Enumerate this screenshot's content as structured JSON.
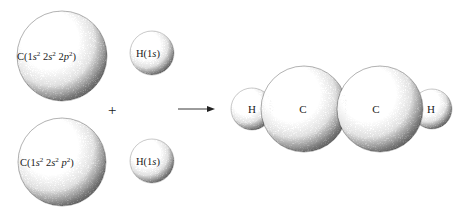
{
  "diagram": {
    "type": "reaction-schematic",
    "colors": {
      "background": "#ffffff",
      "sphere_light": "#ffffff",
      "sphere_dark": "#1a1a1a",
      "text": "#1a1a1a"
    },
    "reactants": [
      {
        "id": "carbon-top",
        "element": "C",
        "config_text": "C(1s² 2s² 2p²)",
        "parts": {
          "prefix": "C(1",
          "s1": "s",
          "e1": "2",
          "mid1": " 2",
          "s2": "s",
          "e2": "2",
          "mid2": " 2",
          "p": "p",
          "e3": "2",
          "suffix": ")"
        },
        "cx": 62,
        "cy": 56,
        "r": 45
      },
      {
        "id": "hydrogen-top",
        "element": "H",
        "config_text": "H(1s)",
        "parts": {
          "prefix": "H(1",
          "s": "s",
          "suffix": ")"
        },
        "cx": 152,
        "cy": 53,
        "r": 22
      },
      {
        "id": "carbon-bottom",
        "element": "C",
        "config_text": "C(1s² 2s² p²)",
        "parts": {
          "prefix": "C(1",
          "s1": "s",
          "e1": "2",
          "mid1": " 2",
          "s2": "s",
          "e2": "2",
          "p": "p",
          "e3": "2",
          "suffix": ")"
        },
        "cx": 62,
        "cy": 162,
        "r": 44
      },
      {
        "id": "hydrogen-bottom",
        "element": "H",
        "config_text": "H(1s)",
        "parts": {
          "prefix": "H(1",
          "s": "s",
          "suffix": ")"
        },
        "cx": 152,
        "cy": 161,
        "r": 22
      }
    ],
    "operators": {
      "plus": "+",
      "arrow": "→"
    },
    "product": {
      "formula": "H-C-C-H",
      "atoms": [
        {
          "id": "product-h-left",
          "label": "H",
          "cx": 252,
          "cy": 109,
          "r": 21
        },
        {
          "id": "product-c-left",
          "label": "C",
          "cx": 304,
          "cy": 109,
          "r": 43
        },
        {
          "id": "product-c-right",
          "label": "C",
          "cx": 380,
          "cy": 109,
          "r": 43
        },
        {
          "id": "product-h-right",
          "label": "H",
          "cx": 432,
          "cy": 109,
          "r": 20
        }
      ]
    }
  }
}
